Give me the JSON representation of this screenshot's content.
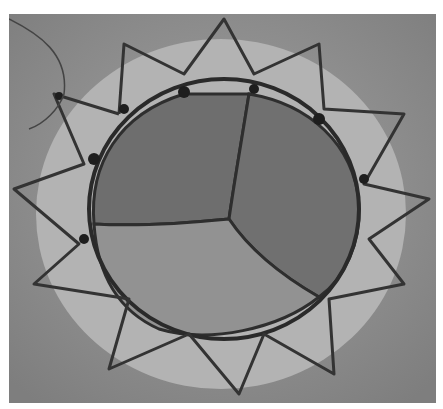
{
  "image": {
    "subject": "transcatheter-heart-valve",
    "description": "Top-down grayscale photograph of a prosthetic heart valve: a zig-zag wire stent frame surrounding three closed leaflets meeting at a central coaptation point.",
    "colors": {
      "background": "#8e8e8e",
      "skirt": "#b8b8b8",
      "leaflet_upper": "#6f6f6f",
      "leaflet_lower": "#909090",
      "frame": "#2a2a2a",
      "border": "#ffffff"
    },
    "leaflet_count": 3
  }
}
